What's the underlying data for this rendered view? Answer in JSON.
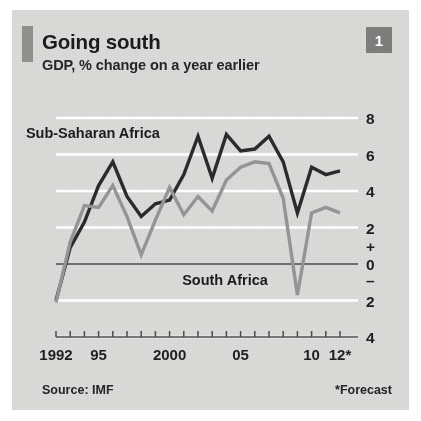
{
  "figure": {
    "number_badge": "1",
    "title": "Going south",
    "subtitle": "GDP, % change on a year earlier",
    "source": "Source: IMF",
    "forecast_note": "*Forecast",
    "accent_color": "#8f8f8d",
    "background_color": "#dcdcda"
  },
  "chart_data": {
    "type": "line",
    "title": "Going south",
    "subtitle": "GDP, % change on a year earlier",
    "xlabel": "",
    "ylabel": "GDP, % change on a year earlier",
    "ylim": [
      -4,
      8
    ],
    "xlim": [
      1992,
      2012
    ],
    "yticks": [
      8,
      6,
      4,
      2,
      0,
      -2,
      -4
    ],
    "ytick_labels": [
      "8",
      "6",
      "4",
      "2",
      "0",
      "2",
      "4"
    ],
    "sign_markers": {
      "plus": "+",
      "minus": "–"
    },
    "xticks": [
      1992,
      1993,
      1994,
      1995,
      1996,
      1997,
      1998,
      1999,
      2000,
      2001,
      2002,
      2003,
      2004,
      2005,
      2006,
      2007,
      2008,
      2009,
      2010,
      2011,
      2012
    ],
    "xtick_labels_shown": [
      "1992",
      "95",
      "2000",
      "05",
      "10",
      "12*"
    ],
    "xtick_label_years": [
      1992,
      1995,
      2000,
      2005,
      2010,
      2012
    ],
    "grid": "horizontal",
    "legend_position": "inline-annotations",
    "series": [
      {
        "name": "Sub-Saharan Africa",
        "color": "#2b2b2b",
        "label_x": 1994.6,
        "label_y": 6.9,
        "x": [
          1992,
          1993,
          1994,
          1995,
          1996,
          1997,
          1998,
          1999,
          2000,
          2001,
          2002,
          2003,
          2004,
          2005,
          2006,
          2007,
          2008,
          2009,
          2010,
          2011,
          2012
        ],
        "values": [
          -2.0,
          0.9,
          2.3,
          4.3,
          5.6,
          3.7,
          2.6,
          3.3,
          3.5,
          4.9,
          7.0,
          4.7,
          7.1,
          6.2,
          6.3,
          7.0,
          5.6,
          2.8,
          5.3,
          4.9,
          5.1
        ]
      },
      {
        "name": "South Africa",
        "color": "#949494",
        "label_x": 2003.9,
        "label_y": -1.15,
        "x": [
          1992,
          1993,
          1994,
          1995,
          1996,
          1997,
          1998,
          1999,
          2000,
          2001,
          2002,
          2003,
          2004,
          2005,
          2006,
          2007,
          2008,
          2009,
          2010,
          2011,
          2012
        ],
        "values": [
          -2.1,
          1.2,
          3.2,
          3.1,
          4.3,
          2.6,
          0.5,
          2.4,
          4.2,
          2.7,
          3.7,
          2.9,
          4.6,
          5.3,
          5.6,
          5.5,
          3.6,
          -1.7,
          2.8,
          3.1,
          2.8
        ]
      }
    ]
  }
}
